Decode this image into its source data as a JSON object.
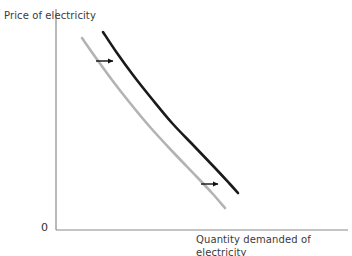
{
  "chart_data": {
    "type": "line",
    "title": "",
    "xlabel": "Quantity demanded of electricity",
    "ylabel": "Price of electricity",
    "origin_label": "0",
    "grid": false,
    "legend": null,
    "axes": {
      "x_axis_color": "#8a8a8a",
      "y_axis_color": "#8a8a8a",
      "x_range_px": [
        56,
        348
      ],
      "y_range_px": [
        9,
        230
      ],
      "ticks": [],
      "tick_labels": []
    },
    "series": [
      {
        "name": "original-demand-curve",
        "color": "#b3b3b3",
        "width": 2.6,
        "description": "downward sloping convex demand curve",
        "points_px": [
          [
            82,
            38
          ],
          [
            96,
            58
          ],
          [
            112,
            80
          ],
          [
            130,
            103
          ],
          [
            150,
            127
          ],
          [
            172,
            151
          ],
          [
            196,
            176
          ],
          [
            212,
            193
          ],
          [
            225,
            208
          ]
        ]
      },
      {
        "name": "shifted-demand-curve",
        "color": "#1a1a1a",
        "width": 2.6,
        "description": "demand curve shifted to the right",
        "points_px": [
          [
            103,
            32
          ],
          [
            117,
            53
          ],
          [
            133,
            75
          ],
          [
            152,
            99
          ],
          [
            172,
            123
          ],
          [
            194,
            146
          ],
          [
            216,
            169
          ],
          [
            229,
            183
          ],
          [
            238,
            193
          ]
        ]
      }
    ],
    "annotations": [
      {
        "name": "shift-arrow-upper",
        "type": "arrow",
        "direction": "right",
        "color": "#111111",
        "from_px": [
          96,
          61
        ],
        "to_px": [
          113,
          61
        ]
      },
      {
        "name": "shift-arrow-lower",
        "type": "arrow",
        "direction": "right",
        "color": "#111111",
        "from_px": [
          201,
          184
        ],
        "to_px": [
          218,
          184
        ]
      }
    ]
  },
  "figure": {
    "background": "#ffffff",
    "width": 352,
    "height": 256
  }
}
